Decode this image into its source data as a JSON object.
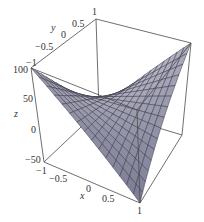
{
  "chart_data": {
    "type": "surface3d",
    "title": "",
    "function_estimate": "z = 25 + 75*x*y",
    "xlabel": "x",
    "ylabel": "y",
    "zlabel": "z",
    "xlim": [
      -1,
      1
    ],
    "ylim": [
      -1,
      1
    ],
    "zlim": [
      -50,
      100
    ],
    "x_ticks": [
      "-1",
      "-0.5",
      "0",
      "0.5",
      "1"
    ],
    "y_ticks": [
      "-1",
      "-0.5",
      "0",
      "0.5",
      "1"
    ],
    "z_ticks": [
      "-50",
      "0",
      "50",
      "100"
    ],
    "grid_divisions": 15,
    "surface_color_light": "#e8e8f0",
    "surface_color_dark": "#50506e",
    "mesh_color": "#2a2a3a",
    "box_color": "#4a4a4a",
    "corner_values": {
      "x-1_y-1": 100,
      "x1_y1": 100,
      "x1_y-1": -50,
      "x-1_y1": -50
    }
  }
}
